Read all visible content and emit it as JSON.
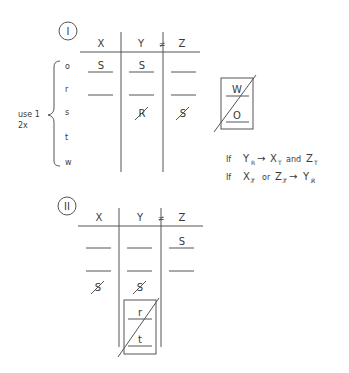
{
  "diagram_1": {
    "label": "I",
    "columns": [
      "X",
      "Y",
      "Z"
    ],
    "not_equal": "≠",
    "brace_label_line1": "use 1",
    "brace_label_line2": "2x",
    "row_labels": [
      "o",
      "r",
      "s",
      "t",
      "w"
    ],
    "cells": {
      "o": {
        "X": "S",
        "Y": "S",
        "Z": ""
      },
      "r": {
        "X": "",
        "Y": "",
        "Z": ""
      },
      "s": {
        "X": "",
        "Y": "R (crossed out)",
        "Z": "S (crossed out)"
      }
    },
    "cell_text": {
      "o_x": "S",
      "o_y": "S",
      "s_y": "R",
      "s_z": "S"
    },
    "side_box": {
      "top": "W",
      "bottom": "O",
      "crossed_out": true
    },
    "rules": [
      {
        "prefix": "If",
        "cond": "Y",
        "cond_sub": "R",
        "arrow": "→",
        "r1": "X",
        "r1_sub": "T",
        "conj": "and",
        "r2": "Z",
        "r2_sub": "T"
      },
      {
        "prefix": "If",
        "cond": "X",
        "cond_sub": "T̸",
        "conj": "or",
        "cond2": "Z",
        "cond2_sub": "T̸",
        "arrow": "→",
        "r1": "Y",
        "r1_sub": "R̸"
      }
    ]
  },
  "diagram_2": {
    "label": "II",
    "columns": [
      "X",
      "Y",
      "Z"
    ],
    "not_equal": "≠",
    "cell_text": {
      "row1_z": "S",
      "row3_x": "S",
      "row3_y": "S"
    },
    "bottom_box": {
      "top": "r",
      "bottom": "t",
      "crossed_out": true
    }
  }
}
